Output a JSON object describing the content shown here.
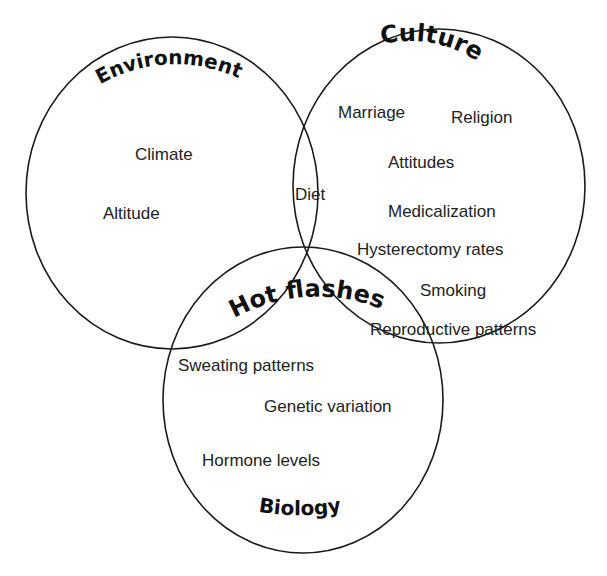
{
  "diagram": {
    "type": "venn",
    "center_label": "Hot flashes",
    "sets": [
      {
        "name": "Environment",
        "items": [
          "Climate",
          "Altitude"
        ]
      },
      {
        "name": "Culture",
        "items": [
          "Marriage",
          "Religion",
          "Attitudes",
          "Medicalization",
          "Hysterectomy rates",
          "Smoking",
          "Reproductive patterns"
        ]
      },
      {
        "name": "Biology",
        "items": [
          "Sweating patterns",
          "Genetic variation",
          "Hormone levels"
        ]
      }
    ],
    "intersections": [
      {
        "sets": [
          "Environment",
          "Culture"
        ],
        "items": [
          "Diet"
        ]
      }
    ]
  },
  "labels": {
    "environment": "Environment",
    "culture": "Culture",
    "biology": "Biology",
    "hot_flashes": "Hot flashes",
    "climate": "Climate",
    "altitude": "Altitude",
    "diet": "Diet",
    "marriage": "Marriage",
    "religion": "Religion",
    "attitudes": "Attitudes",
    "medicalization": "Medicalization",
    "hysterectomy_rates": "Hysterectomy rates",
    "smoking": "Smoking",
    "reproductive_patterns": "Reproductive patterns",
    "sweating_patterns": "Sweating patterns",
    "genetic_variation": "Genetic variation",
    "hormone_levels": "Hormone levels"
  }
}
